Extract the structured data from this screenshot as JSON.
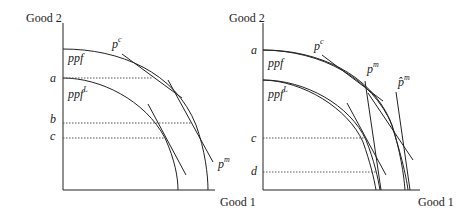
{
  "panels": [
    {
      "id": "left",
      "y_axis_label": "Good 2",
      "x_axis_label": "Good 1",
      "curves": [
        {
          "name": "ppf",
          "label": "ppf",
          "sup": ""
        },
        {
          "name": "ppf_L",
          "label": "ppf",
          "sup": "L"
        }
      ],
      "price_lines": [
        {
          "label": "p",
          "sup": "c"
        },
        {
          "label": "p",
          "sup": "m"
        }
      ],
      "y_ticks": [
        "a",
        "b",
        "c"
      ]
    },
    {
      "id": "right",
      "y_axis_label": "Good 2",
      "x_axis_label": "Good 1",
      "curves": [
        {
          "name": "ppf",
          "label": "ppf",
          "sup": ""
        },
        {
          "name": "ppf_L",
          "label": "ppf",
          "sup": "L"
        }
      ],
      "price_lines": [
        {
          "label": "p",
          "sup": "c"
        },
        {
          "label": "p",
          "sup": "m"
        },
        {
          "label": "p̂",
          "sup": "m"
        }
      ],
      "y_ticks": [
        "a",
        "c",
        "d"
      ]
    }
  ],
  "colors": {
    "line": "#222222",
    "dotted": "#555555",
    "background": "#ffffff"
  }
}
